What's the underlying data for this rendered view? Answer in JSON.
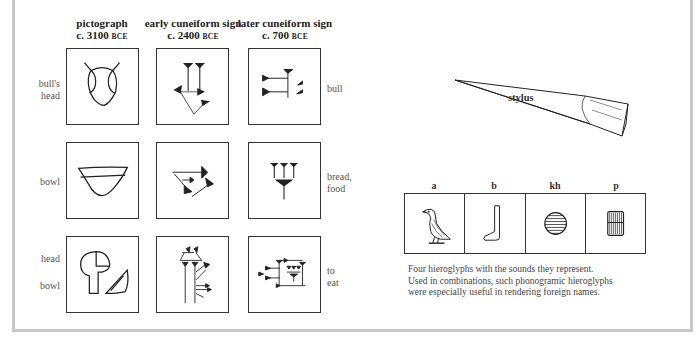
{
  "columns": [
    {
      "title": "pictograph",
      "date": "c. 3100",
      "era": "BCE"
    },
    {
      "title": "early cuneiform sign",
      "date": "c. 2400",
      "era": "BCE"
    },
    {
      "title": "later cuneiform sign",
      "date": "c. 700",
      "era": "BCE"
    }
  ],
  "rows": [
    {
      "left_label": [
        "bull's",
        "head"
      ],
      "right_label": [
        "bull"
      ]
    },
    {
      "left_label": [
        "bowl"
      ],
      "right_label": [
        "bread,",
        "food"
      ]
    },
    {
      "left_label": [
        "head",
        "bowl"
      ],
      "right_label": [
        "to",
        "eat"
      ]
    }
  ],
  "stylus": {
    "label": "stylus"
  },
  "hieroglyphs": {
    "sounds": [
      "a",
      "b",
      "kh",
      "p"
    ],
    "icons": [
      "vulture-icon",
      "foot-icon",
      "placenta-disc-icon",
      "stool-mat-icon"
    ],
    "caption": [
      "Four hieroglyphs with the sounds they represent.",
      "Used in combinations, such phonogramic  hieroglyphs",
      "were especially useful in rendering foreign names."
    ]
  },
  "colors": {
    "border": "#c9c9c9",
    "ink": "#222222",
    "label": "#555555"
  }
}
